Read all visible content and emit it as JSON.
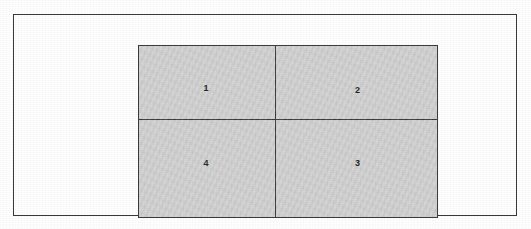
{
  "figure": {
    "type": "quadrant-diagram",
    "outer_frame": {
      "present": true,
      "border_color": "#3a3a3a"
    },
    "grid": {
      "rows": 2,
      "columns": 2,
      "fill_color": "#d3d3d3",
      "border_color": "#3c3c3c",
      "quadrants": [
        {
          "position": "top-left",
          "label": "1"
        },
        {
          "position": "top-right",
          "label": "2"
        },
        {
          "position": "bottom-left",
          "label": "4"
        },
        {
          "position": "bottom-right",
          "label": "3"
        }
      ]
    }
  }
}
